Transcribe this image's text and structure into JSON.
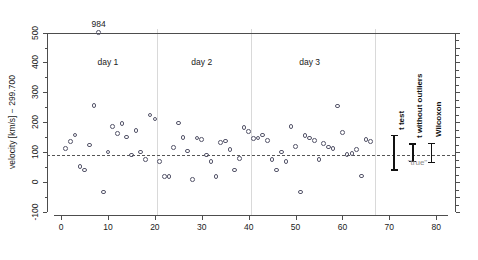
{
  "chart_data": {
    "type": "scatter",
    "title": "",
    "xlabel": "",
    "ylabel": "velocity [km/s] − 299.700",
    "xlim": [
      -3,
      84
    ],
    "ylim": [
      -110,
      512
    ],
    "xticks": [
      0,
      10,
      20,
      30,
      40,
      50,
      60,
      70,
      80
    ],
    "yticks": [
      -100,
      0,
      100,
      200,
      300,
      400,
      500
    ],
    "grid": false,
    "legend": "none",
    "reference_line": {
      "y": 92,
      "style": "dashed",
      "label": "\"true\""
    },
    "annotations": [
      {
        "text": "984",
        "x": 8,
        "y": 500,
        "note": "outlier label above clipped point"
      },
      {
        "text": "day 1",
        "x": 10,
        "y": 400
      },
      {
        "text": "day 2",
        "x": 30,
        "y": 400
      },
      {
        "text": "day 3",
        "x": 53,
        "y": 400
      }
    ],
    "day_separators": [
      20.5,
      40.5,
      67.0
    ],
    "series": [
      {
        "name": "measurements",
        "marker": "open-circle",
        "x": [
          1,
          2,
          3,
          4,
          5,
          6,
          7,
          8,
          9,
          10,
          11,
          12,
          13,
          14,
          15,
          16,
          17,
          18,
          19,
          20,
          21,
          22,
          23,
          24,
          25,
          26,
          27,
          28,
          29,
          30,
          31,
          32,
          33,
          34,
          35,
          36,
          37,
          38,
          39,
          40,
          41,
          42,
          43,
          44,
          45,
          46,
          47,
          48,
          49,
          50,
          51,
          52,
          53,
          54,
          55,
          56,
          57,
          58,
          59,
          60,
          61,
          62,
          63,
          64,
          65,
          66
        ],
        "y": [
          113,
          136,
          158,
          52,
          41,
          124,
          256,
          500,
          -33,
          100,
          185,
          163,
          196,
          151,
          90,
          172,
          101,
          75,
          224,
          211,
          68,
          18,
          18,
          115,
          198,
          150,
          104,
          8,
          148,
          142,
          90,
          68,
          18,
          132,
          137,
          110,
          40,
          78,
          183,
          170,
          145,
          148,
          158,
          140,
          75,
          40,
          100,
          68,
          185,
          120,
          -33,
          155,
          148,
          140,
          75,
          130,
          118,
          112,
          255,
          166,
          92,
          95,
          110,
          20,
          142,
          135
        ]
      }
    ],
    "error_bars": [
      {
        "label": "t test",
        "x": 71,
        "center": 92,
        "low": 40,
        "high": 155
      },
      {
        "label": "t without outliers",
        "x": 75,
        "center": 92,
        "low": 68,
        "high": 128
      },
      {
        "label": "Wilcoxon",
        "x": 79,
        "center": 92,
        "low": 66,
        "high": 130
      }
    ],
    "colors": {
      "marker": "#55556a",
      "axis": "#4d4d4d",
      "separator": "#d9d9d9",
      "reference": "#555555",
      "errorbar": "#111111",
      "true_label": "#8a8a8a"
    }
  }
}
